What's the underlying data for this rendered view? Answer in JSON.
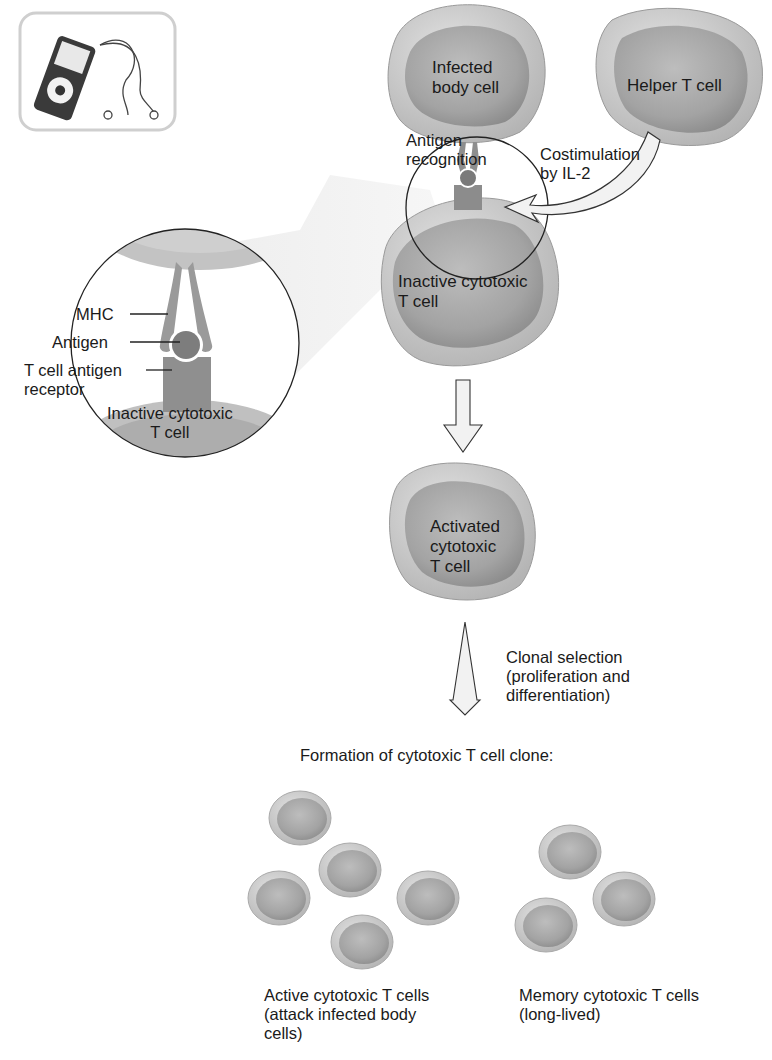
{
  "icon": {
    "name": "audio-player-icon"
  },
  "cells": {
    "infected": "Infected\nbody cell",
    "helper": "Helper T cell",
    "inactive": "Inactive cytotoxic\nT cell",
    "activated": "Activated\ncytotoxic\nT cell"
  },
  "labels": {
    "antigen_recognition": "Antigen\nrecognition",
    "costimulation": "Costimulation\nby IL-2",
    "clonal_selection": "Clonal selection\n(proliferation and\ndifferentiation)",
    "formation": "Formation of cytotoxic T cell clone:",
    "active_cells": "Active cytotoxic T cells\n(attack infected body\ncells)",
    "memory_cells": "Memory cytotoxic T cells\n(long-lived)"
  },
  "inset": {
    "mhc": "MHC",
    "antigen": "Antigen",
    "receptor": "T cell antigen\nreceptor",
    "cell": "Inactive cytotoxic\nT cell"
  },
  "colors": {
    "cell_outer": "#c9c9c9",
    "cell_inner": "#9e9e9e",
    "line": "#222222",
    "arrow_fill": "#ececec"
  }
}
